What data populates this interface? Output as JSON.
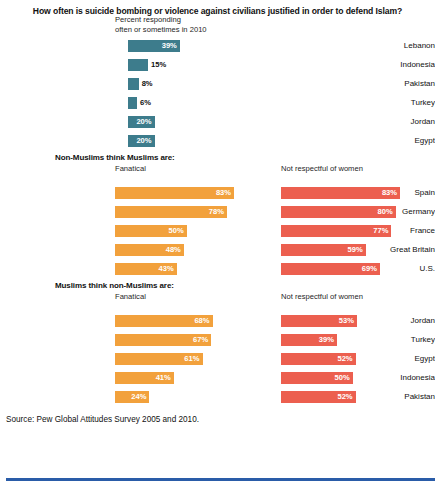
{
  "title": "How often is suicide bombing or violence against civilians justified in order to defend Islam?",
  "source": "Source: Pew Global Attitudes Survey 2005 and 2010.",
  "colors": {
    "teal": "#3d7c8c",
    "orange": "#f2a13c",
    "red": "#ec5f4f",
    "rule": "#2a5ca8",
    "text": "#111111"
  },
  "sections": {
    "s1": {
      "subtitle_line1": "Percent responding",
      "subtitle_line2": "often or sometimes in 2010",
      "rows": [
        {
          "label": "Lebanon",
          "value": "39%",
          "pct": 39
        },
        {
          "label": "Indonesia",
          "value": "15%",
          "pct": 15
        },
        {
          "label": "Pakistan",
          "value": "8%",
          "pct": 8
        },
        {
          "label": "Turkey",
          "value": "6%",
          "pct": 6
        },
        {
          "label": "Jordan",
          "value": "20%",
          "pct": 20
        },
        {
          "label": "Egypt",
          "value": "20%",
          "pct": 20
        }
      ]
    },
    "s2": {
      "heading": "Non-Muslims think Muslims are:",
      "col_left": "Fanatical",
      "col_right": "Not respectful of women",
      "rows": [
        {
          "label": "Spain",
          "left_value": "83%",
          "left_pct": 83,
          "right_value": "83%",
          "right_pct": 83
        },
        {
          "label": "Germany",
          "left_value": "78%",
          "left_pct": 78,
          "right_value": "80%",
          "right_pct": 80
        },
        {
          "label": "France",
          "left_value": "50%",
          "left_pct": 50,
          "right_value": "77%",
          "right_pct": 77
        },
        {
          "label": "Great Britain",
          "left_value": "48%",
          "left_pct": 48,
          "right_value": "59%",
          "right_pct": 59
        },
        {
          "label": "U.S.",
          "left_value": "43%",
          "left_pct": 43,
          "right_value": "69%",
          "right_pct": 69
        }
      ]
    },
    "s3": {
      "heading": "Muslims think non-Muslims are:",
      "col_left": "Fanatical",
      "col_right": "Not respectful of women",
      "rows": [
        {
          "label": "Jordan",
          "left_value": "68%",
          "left_pct": 68,
          "right_value": "53%",
          "right_pct": 53
        },
        {
          "label": "Turkey",
          "left_value": "67%",
          "left_pct": 67,
          "right_value": "39%",
          "right_pct": 39
        },
        {
          "label": "Egypt",
          "left_value": "61%",
          "left_pct": 61,
          "right_value": "52%",
          "right_pct": 52
        },
        {
          "label": "Indonesia",
          "left_value": "41%",
          "left_pct": 41,
          "right_value": "50%",
          "right_pct": 50
        },
        {
          "label": "Pakistan",
          "left_value": "24%",
          "left_pct": 24,
          "right_value": "52%",
          "right_pct": 52
        }
      ]
    }
  },
  "chart_data": [
    {
      "type": "bar",
      "title": "How often is suicide bombing or violence against civilians justified in order to defend Islam?",
      "subtitle": "Percent responding often or sometimes in 2010",
      "orientation": "horizontal",
      "categories": [
        "Lebanon",
        "Indonesia",
        "Pakistan",
        "Turkey",
        "Jordan",
        "Egypt"
      ],
      "values": [
        39,
        15,
        8,
        6,
        20,
        20
      ],
      "xlabel": "Percent",
      "ylabel": "",
      "xlim": [
        0,
        100
      ],
      "grid": false,
      "legend": "none",
      "color": "#3d7c8c"
    },
    {
      "type": "bar",
      "title": "Non-Muslims think Muslims are:",
      "orientation": "horizontal",
      "categories": [
        "Spain",
        "Germany",
        "France",
        "Great Britain",
        "U.S."
      ],
      "series": [
        {
          "name": "Fanatical",
          "values": [
            83,
            78,
            50,
            48,
            43
          ],
          "color": "#f2a13c"
        },
        {
          "name": "Not respectful of women",
          "values": [
            83,
            80,
            77,
            59,
            69
          ],
          "color": "#ec5f4f"
        }
      ],
      "xlabel": "Percent",
      "ylabel": "",
      "xlim": [
        0,
        100
      ],
      "grid": false,
      "legend": "column-headers"
    },
    {
      "type": "bar",
      "title": "Muslims think non-Muslims are:",
      "orientation": "horizontal",
      "categories": [
        "Jordan",
        "Turkey",
        "Egypt",
        "Indonesia",
        "Pakistan"
      ],
      "series": [
        {
          "name": "Fanatical",
          "values": [
            68,
            67,
            61,
            41,
            24
          ],
          "color": "#f2a13c"
        },
        {
          "name": "Not respectful of women",
          "values": [
            53,
            39,
            52,
            50,
            52
          ],
          "color": "#ec5f4f"
        }
      ],
      "xlabel": "Percent",
      "ylabel": "",
      "xlim": [
        0,
        100
      ],
      "grid": false,
      "legend": "column-headers"
    }
  ]
}
